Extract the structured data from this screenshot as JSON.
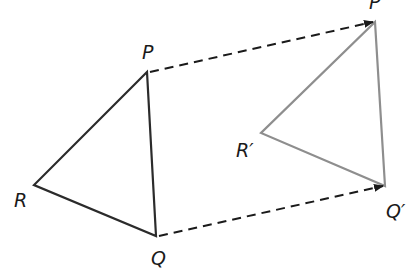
{
  "diagram": {
    "colors": {
      "original": "#2b2b2b",
      "image": "#8e8e8e",
      "arrow": "#1a1a1a",
      "background": "#ffffff"
    },
    "original_triangle": {
      "vertices": [
        {
          "name": "P",
          "x": 147,
          "y": 72,
          "label_x": 142,
          "label_y": 59
        },
        {
          "name": "Q",
          "x": 156,
          "y": 236,
          "label_x": 151,
          "label_y": 265
        },
        {
          "name": "R",
          "x": 34,
          "y": 185,
          "label_x": 14,
          "label_y": 207
        }
      ]
    },
    "image_triangle": {
      "vertices": [
        {
          "name": "P′",
          "x": 375,
          "y": 22,
          "label_x": 369,
          "label_y": 9
        },
        {
          "name": "Q′",
          "x": 385,
          "y": 186,
          "label_x": 386,
          "label_y": 218
        },
        {
          "name": "R′",
          "x": 261,
          "y": 133,
          "label_x": 236,
          "label_y": 157
        }
      ]
    },
    "translation_arrows": [
      {
        "from": "P",
        "to": "P′",
        "x1": 150,
        "y1": 72,
        "x2": 373,
        "y2": 22
      },
      {
        "from": "Q",
        "to": "Q′",
        "x1": 159,
        "y1": 236,
        "x2": 383,
        "y2": 186
      }
    ],
    "labels": {
      "P": "P",
      "Q": "Q",
      "R": "R",
      "P_prime": "P′",
      "Q_prime": "Q′",
      "R_prime": "R′"
    }
  }
}
